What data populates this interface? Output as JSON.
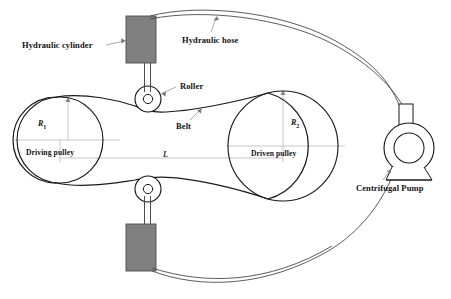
{
  "figure": {
    "type": "engineering-schematic",
    "background_color": "#ffffff",
    "line_color": "#1a1a1a",
    "dim_line_color": "#9a9a9a",
    "cylinder_fill": "#808080",
    "cylinder_stroke": "#4d4d4d"
  },
  "labels": {
    "hydraulic_cylinder": "Hydraulic cylinder",
    "hydraulic_hose": "Hydraulic hose",
    "roller": "Roller",
    "belt": "Belt",
    "driving_pulley": "Driving pulley",
    "driven_pulley": "Driven pulley",
    "centrifugal_pump": "Centrifugal Pump",
    "radius_1": "R",
    "radius_1_sub": "1",
    "radius_2": "R",
    "radius_2_sub": "2",
    "center_distance": "L"
  },
  "components": {
    "driving_pulley": {
      "cx": 60,
      "cy": 140,
      "r": 43,
      "radius_symbol": "R1"
    },
    "driven_pulley": {
      "cx": 283,
      "cy": 146,
      "r": 55,
      "radius_symbol": "R2"
    },
    "upper_roller": {
      "cx": 148,
      "cy": 99,
      "r": 13,
      "hub_r": 5
    },
    "lower_roller": {
      "cx": 148,
      "cy": 189,
      "r": 13,
      "hub_r": 5
    },
    "upper_cylinder": {
      "x": 126,
      "y": 16,
      "w": 30,
      "h": 47
    },
    "lower_cylinder": {
      "x": 126,
      "y": 224,
      "w": 30,
      "h": 47
    },
    "pump": {
      "cx": 409,
      "cy": 148,
      "outer_r": 25,
      "inner_r": 15,
      "outlet_x": 399,
      "outlet_y": 105,
      "outlet_w": 14,
      "outlet_h": 25
    }
  }
}
